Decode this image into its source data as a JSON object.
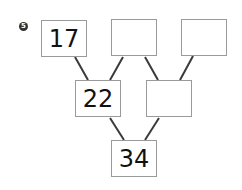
{
  "problem_number": "5",
  "colors": {
    "line": "#3a3a3a",
    "box_border": "#9a9a9a",
    "badge": "#333333"
  },
  "boxes": {
    "top_left": "17",
    "top_middle": "",
    "top_right": "",
    "middle_left": "22",
    "middle_right": "",
    "bottom": "34"
  }
}
